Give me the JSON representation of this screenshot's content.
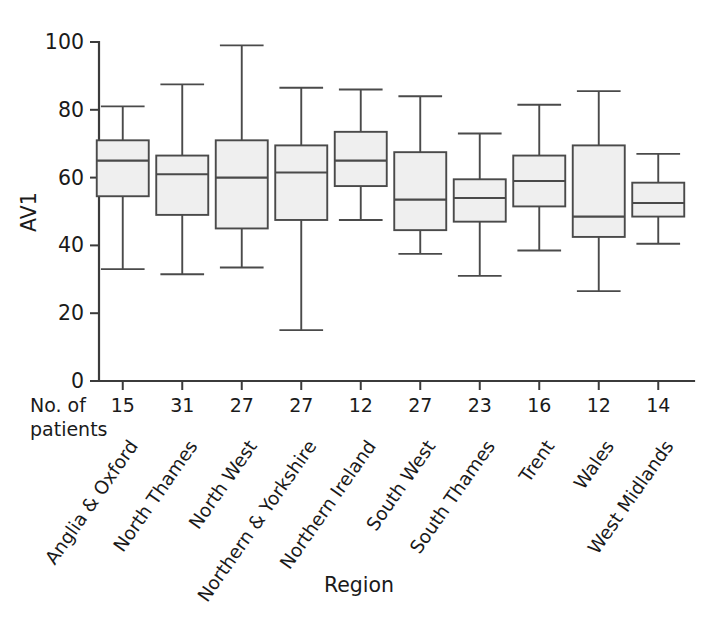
{
  "chart_data": {
    "type": "box",
    "title": "",
    "xlabel": "Region",
    "ylabel": "AV1",
    "ylim": [
      0,
      100
    ],
    "yticks": [
      0,
      20,
      40,
      60,
      80,
      100
    ],
    "ytick_labels": [
      "0",
      "20",
      "40",
      "60",
      "80",
      "100"
    ],
    "grid": false,
    "legend": false,
    "count_row_label_line1": "No. of",
    "count_row_label_line2": "patients",
    "categories": [
      "Anglia & Oxford",
      "North Thames",
      "North West",
      "Northern & Yorkshire",
      "Northern Ireland",
      "South West",
      "South Thames",
      "Trent",
      "Wales",
      "West Midlands"
    ],
    "counts": [
      15,
      31,
      27,
      27,
      12,
      27,
      23,
      16,
      12,
      14
    ],
    "boxes": [
      {
        "category": "Anglia & Oxford",
        "n": 15,
        "min": 33.0,
        "q1": 54.5,
        "median": 65.0,
        "q3": 71.0,
        "max": 81.0
      },
      {
        "category": "North Thames",
        "n": 31,
        "min": 31.5,
        "q1": 49.0,
        "median": 61.0,
        "q3": 66.5,
        "max": 87.5
      },
      {
        "category": "North West",
        "n": 27,
        "min": 33.5,
        "q1": 45.0,
        "median": 60.0,
        "q3": 71.0,
        "max": 99.0
      },
      {
        "category": "Northern & Yorkshire",
        "n": 27,
        "min": 15.0,
        "q1": 47.5,
        "median": 61.5,
        "q3": 69.5,
        "max": 86.5
      },
      {
        "category": "Northern Ireland",
        "n": 12,
        "min": 47.5,
        "q1": 57.5,
        "median": 65.0,
        "q3": 73.5,
        "max": 86.0
      },
      {
        "category": "South West",
        "n": 27,
        "min": 37.5,
        "q1": 44.5,
        "median": 53.5,
        "q3": 67.5,
        "max": 84.0
      },
      {
        "category": "South Thames",
        "n": 23,
        "min": 31.0,
        "q1": 47.0,
        "median": 54.0,
        "q3": 59.5,
        "max": 73.0
      },
      {
        "category": "Trent",
        "n": 16,
        "min": 38.5,
        "q1": 51.5,
        "median": 59.0,
        "q3": 66.5,
        "max": 81.5
      },
      {
        "category": "Wales",
        "n": 12,
        "min": 26.5,
        "q1": 42.5,
        "median": 48.5,
        "q3": 69.5,
        "max": 85.5
      },
      {
        "category": "West Midlands",
        "n": 14,
        "min": 40.5,
        "q1": 48.5,
        "median": 52.5,
        "q3": 58.5,
        "max": 67.0
      }
    ],
    "colors": {
      "box_fill": "#efefef",
      "box_stroke": "#4a4a4a",
      "axis": "#3b3b3b",
      "text": "#1a1a1a",
      "background": "#ffffff"
    }
  }
}
